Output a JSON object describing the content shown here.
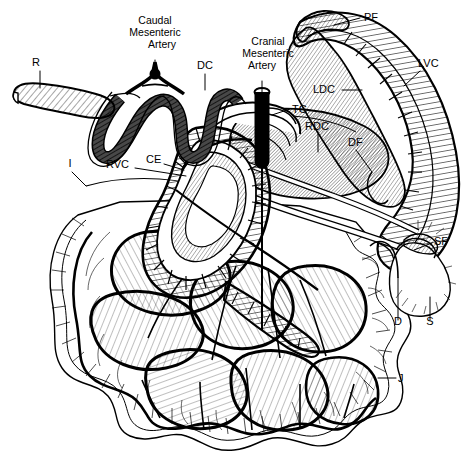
{
  "figure": {
    "style": "black-and-white line drawing with hatched shading",
    "background_color": "#ffffff",
    "ink_color": "#000000",
    "width": 472,
    "height": 457
  },
  "labels": [
    {
      "id": "R",
      "text": "R",
      "full_name": "Rectum",
      "x": 36,
      "y": 66,
      "anchor": "middle",
      "leader": "M40,71 L40,88"
    },
    {
      "id": "CMA",
      "text_lines": [
        "Caudal",
        "Mesenteric",
        "Artery"
      ],
      "full_name": "Caudal Mesenteric Artery",
      "x": 155,
      "y": 24,
      "anchor": "middle",
      "line_height": 12,
      "leader": "M155,60 L155,76"
    },
    {
      "id": "DC",
      "text": "DC",
      "full_name": "Descending Colon",
      "x": 205,
      "y": 69,
      "anchor": "middle",
      "leader": "M205,74 L205,90"
    },
    {
      "id": "CRMA",
      "text_lines": [
        "Cranial",
        "Mesenteric",
        "Artery"
      ],
      "full_name": "Cranial Mesenteric Artery",
      "x": 268,
      "y": 45,
      "anchor": "middle",
      "line_height": 12,
      "leader": "M262,81 L262,92"
    },
    {
      "id": "PF",
      "text": "PF",
      "full_name": "Proximal Flexure",
      "x": 364,
      "y": 21,
      "anchor": "start",
      "leader": "M360,18 L334,25"
    },
    {
      "id": "LVC",
      "text": "LVC",
      "full_name": "Laeval (Left) Ventral Colon",
      "x": 418,
      "y": 67,
      "anchor": "start",
      "leader": "M420,71 L404,86"
    },
    {
      "id": "LDC",
      "text": "LDC",
      "full_name": "Laeval (Left) Dorsal Colon",
      "x": 313,
      "y": 93,
      "anchor": "start",
      "leader": "M342,90 L362,90"
    },
    {
      "id": "TC",
      "text": "TC",
      "full_name": "Transverse Colon",
      "x": 292,
      "y": 113,
      "anchor": "start",
      "leader": "M290,109 L272,115"
    },
    {
      "id": "RDC",
      "text": "RDC",
      "full_name": "Right Dorsal Colon",
      "x": 305,
      "y": 130,
      "anchor": "start",
      "leader": "M318,134 L318,152"
    },
    {
      "id": "DF",
      "text": "DF",
      "full_name": "Diaphragmatic Flexure",
      "x": 348,
      "y": 146,
      "anchor": "start",
      "leader": "M356,150 L372,172"
    },
    {
      "id": "I",
      "text": "I",
      "full_name": "Ileum",
      "x": 70,
      "y": 167,
      "anchor": "middle",
      "leader": "M72,172 L86,186"
    },
    {
      "id": "RVC",
      "text": "RVC",
      "full_name": "Right Ventral Colon",
      "x": 106,
      "y": 168,
      "anchor": "start",
      "leader": "M135,168 L186,176"
    },
    {
      "id": "CE",
      "text": "CE",
      "full_name": "Cecum",
      "x": 146,
      "y": 163,
      "anchor": "start",
      "leader": "M164,164 L184,170"
    },
    {
      "id": "SF",
      "text": "SF",
      "full_name": "Sternal Flexure",
      "x": 434,
      "y": 245,
      "anchor": "start",
      "leader": "M432,243 L414,250"
    },
    {
      "id": "D",
      "text": "D",
      "full_name": "Duodenum",
      "x": 398,
      "y": 325,
      "anchor": "middle",
      "leader": "M398,320 L398,278"
    },
    {
      "id": "S",
      "text": "S",
      "full_name": "Stomach",
      "x": 430,
      "y": 325,
      "anchor": "middle",
      "leader": "M430,320 L430,297"
    },
    {
      "id": "J",
      "text": "J",
      "full_name": "Jejunum",
      "x": 398,
      "y": 382,
      "anchor": "start",
      "leader": "M396,378 L378,378"
    }
  ],
  "structures": [
    {
      "name": "rectum",
      "code": "R",
      "shading": "diagonal-hatch"
    },
    {
      "name": "descending-colon",
      "code": "DC",
      "shading": "dark-segmented"
    },
    {
      "name": "cecum",
      "code": "CE",
      "shading": "coiled-segmented"
    },
    {
      "name": "spiral-colon",
      "code": "",
      "shading": "coiled"
    },
    {
      "name": "right-dorsal-colon",
      "code": "RDC",
      "shading": "diagonal-hatch"
    },
    {
      "name": "left-ventral-colon",
      "code": "LVC",
      "shading": "segmented-hatch"
    },
    {
      "name": "left-dorsal-colon",
      "code": "LDC",
      "shading": "diagonal-hatch"
    },
    {
      "name": "jejunum",
      "code": "J",
      "shading": "line-hatch-lobes"
    },
    {
      "name": "ileum",
      "code": "I",
      "shading": "outline"
    },
    {
      "name": "stomach",
      "code": "S",
      "shading": "outline"
    },
    {
      "name": "duodenum",
      "code": "D",
      "shading": "outline"
    },
    {
      "name": "cranial-mesenteric-artery",
      "code": "CRMA",
      "shading": "solid-black"
    },
    {
      "name": "caudal-mesenteric-artery",
      "code": "CMA",
      "shading": "solid-black"
    }
  ]
}
